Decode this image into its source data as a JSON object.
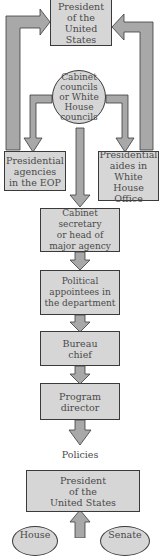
{
  "diagram": {
    "type": "flowchart",
    "colors": {
      "fill": "#d6d6d6",
      "arrow": "#a8a8a8",
      "outline": "#3a3a3a",
      "text": "#4a4a4a"
    },
    "nodes": {
      "president_top": "President\nof the\nUnited\nStates",
      "cabinet_councils": "Cabinet\ncouncils\nor White\nHouse\ncouncils",
      "presidential_agencies": "Presidential\nagencies\nin the EOP",
      "presidential_aides": "Presidential\naides in\nWhite House\nOffice",
      "cabinet_secretary": "Cabinet secretary\nor head of\nmajor agency",
      "political_appointees": "Political\nappointees in\nthe department",
      "bureau_chief": "Bureau\nchief",
      "program_director": "Program\ndirector",
      "policies": "Policies",
      "president_bottom": "President\nof the\nUnited States",
      "house": "House",
      "senate": "Senate"
    }
  }
}
